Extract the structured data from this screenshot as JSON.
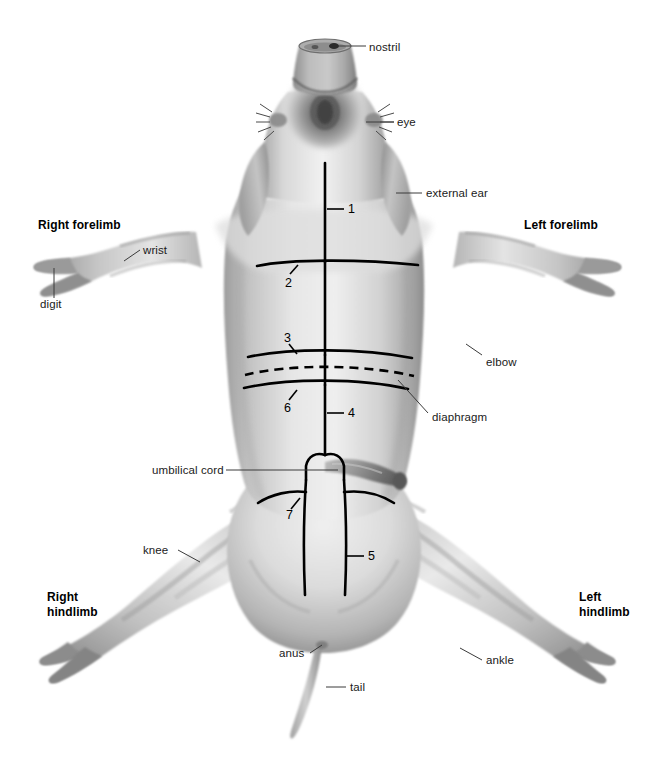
{
  "figure": {
    "background_color": "#ffffff",
    "ink_color": "#000000",
    "body_fill": "#cfcfcf",
    "body_light": "#eeeeee",
    "body_shadow": "#8f8f8f"
  },
  "labels": {
    "nostril": "nostril",
    "eye": "eye",
    "external_ear": "external ear",
    "right_forelimb": "Right forelimb",
    "left_forelimb": "Left forelimb",
    "wrist": "wrist",
    "digit": "digit",
    "elbow": "elbow",
    "diaphragm": "diaphragm",
    "umbilical_cord": "umbilical cord",
    "knee": "knee",
    "ankle": "ankle",
    "anus": "anus",
    "tail": "tail",
    "right_hindlimb": "Right\nhindlimb",
    "left_hindlimb": "Left\nhindlimb"
  },
  "incision_numbers": {
    "n1": "1",
    "n2": "2",
    "n3": "3",
    "n4": "4",
    "n5": "5",
    "n6": "6",
    "n7": "7"
  }
}
